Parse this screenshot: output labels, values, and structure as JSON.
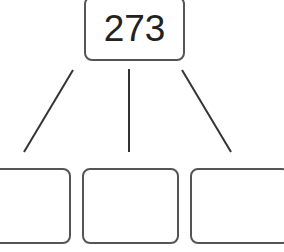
{
  "tree": {
    "root": {
      "value": "273"
    },
    "children": [
      {
        "value": ""
      },
      {
        "value": ""
      },
      {
        "value": ""
      }
    ]
  },
  "colors": {
    "stroke": "#555555",
    "text": "#222222"
  }
}
